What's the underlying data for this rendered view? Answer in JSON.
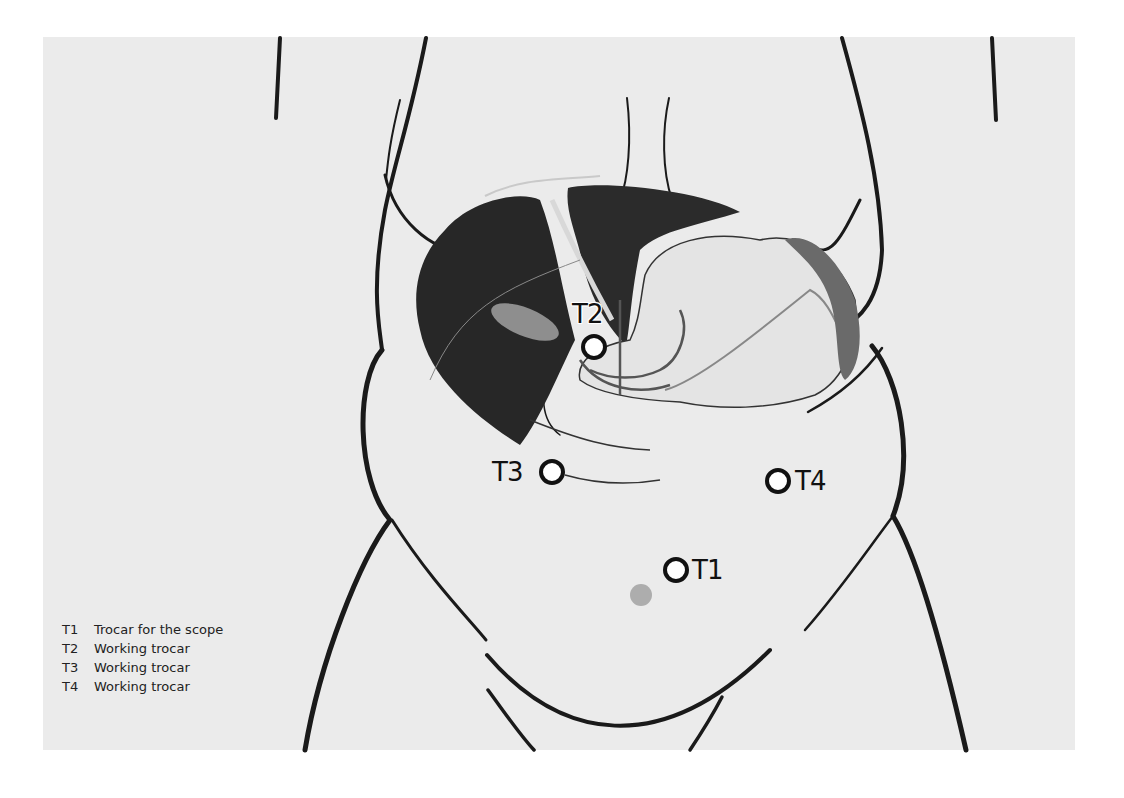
{
  "figure": {
    "background_color": "#ebebeb",
    "outline_color": "#1a1a1a",
    "liver_color": "#262626",
    "stomach_color": "#e2e2e2",
    "spleen_color": "#6a6a6a"
  },
  "ports": [
    {
      "id": "T1",
      "label": "T1",
      "x": 676,
      "y": 570
    },
    {
      "id": "T2",
      "label": "T2",
      "x": 594,
      "y": 347
    },
    {
      "id": "T3",
      "label": "T3",
      "x": 552,
      "y": 472
    },
    {
      "id": "T4",
      "label": "T4",
      "x": 778,
      "y": 481
    }
  ],
  "legend": [
    {
      "key": "T1",
      "text": "Trocar for the scope"
    },
    {
      "key": "T2",
      "text": "Working trocar"
    },
    {
      "key": "T3",
      "text": "Working trocar"
    },
    {
      "key": "T4",
      "text": "Working trocar"
    }
  ]
}
